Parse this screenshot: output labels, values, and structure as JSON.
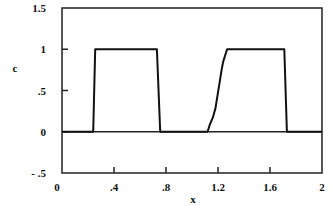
{
  "chart_data": {
    "type": "line",
    "title": "",
    "xlabel": "x",
    "ylabel": "c",
    "xlim": [
      0,
      2
    ],
    "ylim": [
      -0.5,
      1.5
    ],
    "grid": false,
    "legend": null,
    "x_ticks": [
      {
        "value": 0,
        "label": "0"
      },
      {
        "value": 0.4,
        "label": ".4"
      },
      {
        "value": 0.8,
        "label": ".8"
      },
      {
        "value": 1.2,
        "label": "1.2"
      },
      {
        "value": 1.6,
        "label": "1.6"
      },
      {
        "value": 2,
        "label": "2"
      }
    ],
    "y_ticks": [
      {
        "value": 1.5,
        "label": "1.5"
      },
      {
        "value": 1,
        "label": "1"
      },
      {
        "value": 0.5,
        "label": ".5"
      },
      {
        "value": 0,
        "label": "0"
      },
      {
        "value": -0.5,
        "label": "- .5"
      }
    ],
    "reference_lines": [
      {
        "axis": "y",
        "value": 0
      }
    ],
    "series": [
      {
        "name": "c",
        "x": [
          0,
          0.24,
          0.255,
          0.73,
          0.755,
          1.12,
          1.135,
          1.16,
          1.18,
          1.23,
          1.24,
          1.27,
          1.71,
          1.73,
          2.0
        ],
        "y": [
          0,
          0,
          1,
          1,
          0,
          0,
          0.08,
          0.17,
          0.28,
          0.77,
          0.85,
          1,
          1,
          0,
          0
        ]
      }
    ]
  }
}
